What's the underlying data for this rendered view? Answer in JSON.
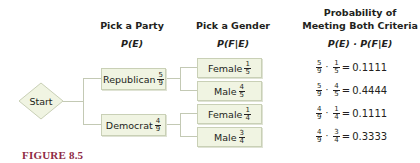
{
  "headers": {
    "party": {
      "title": "Pick a Party",
      "formula": "P(E)"
    },
    "gender": {
      "title": "Pick a Gender",
      "formula": "P(F|E)"
    },
    "probability": {
      "title_line1": "Probability of",
      "title_line2": "Meeting Both Criteria",
      "formula": "P(E) · P(F|E)"
    }
  },
  "start": {
    "label": "Start"
  },
  "parties": [
    {
      "label": "Republican",
      "num": "5",
      "den": "9"
    },
    {
      "label": "Democrat",
      "num": "4",
      "den": "9"
    }
  ],
  "genders": [
    {
      "label": "Female",
      "num": "1",
      "den": "5"
    },
    {
      "label": "Male",
      "num": "4",
      "den": "5"
    },
    {
      "label": "Female",
      "num": "1",
      "den": "4"
    },
    {
      "label": "Male",
      "num": "3",
      "den": "4"
    }
  ],
  "results": [
    {
      "a_num": "5",
      "a_den": "9",
      "b_num": "1",
      "b_den": "5",
      "value": "0.1111"
    },
    {
      "a_num": "5",
      "a_den": "9",
      "b_num": "4",
      "b_den": "5",
      "value": "0.4444"
    },
    {
      "a_num": "4",
      "a_den": "9",
      "b_num": "1",
      "b_den": "4",
      "value": "0.1111"
    },
    {
      "a_num": "4",
      "a_den": "9",
      "b_num": "3",
      "b_den": "4",
      "value": "0.3333"
    }
  ],
  "symbols": {
    "dot": "·",
    "equals": "="
  },
  "caption": "FIGURE 8.5",
  "colors": {
    "box_fill": "#f0f4e2",
    "box_border": "#c9d0b6",
    "connector": "#c3c9b4",
    "caption": "#8e2a45"
  }
}
